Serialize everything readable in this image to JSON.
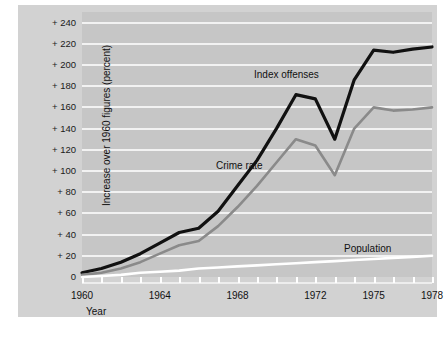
{
  "chart_data": {
    "type": "line",
    "title": "",
    "xlabel": "Year",
    "ylabel": "Increase over 1960 figures (percent)",
    "xlim": [
      1960,
      1978
    ],
    "ylim": [
      0,
      250
    ],
    "grid": true,
    "legend_position": "inline-annotations",
    "x": [
      1960,
      1961,
      1962,
      1963,
      1964,
      1965,
      1966,
      1967,
      1968,
      1969,
      1970,
      1971,
      1972,
      1973,
      1974,
      1975,
      1976,
      1977,
      1978
    ],
    "xtick_labels": [
      "1960",
      "1964",
      "1968",
      "1972",
      "1975",
      "1978"
    ],
    "xtick_values": [
      1960,
      1964,
      1968,
      1972,
      1975,
      1978
    ],
    "ytick_labels": [
      "0",
      "+ 20",
      "+ 40",
      "+ 60",
      "+ 80",
      "+ 100",
      "+ 120",
      "+ 140",
      "+ 160",
      "+ 180",
      "+ 200",
      "+ 220",
      "+ 240"
    ],
    "ytick_values": [
      0,
      20,
      40,
      60,
      80,
      100,
      120,
      140,
      160,
      180,
      200,
      220,
      240
    ],
    "series": [
      {
        "name": "Index offenses",
        "color": "#111111",
        "values": [
          4,
          8,
          14,
          22,
          32,
          42,
          46,
          62,
          86,
          110,
          140,
          172,
          168,
          130,
          186,
          214,
          212,
          215,
          217
        ]
      },
      {
        "name": "Crime rate",
        "color": "#8a8a8a",
        "values": [
          2,
          4,
          8,
          14,
          22,
          30,
          34,
          48,
          66,
          86,
          108,
          130,
          124,
          96,
          140,
          160,
          157,
          158,
          160
        ]
      },
      {
        "name": "Population",
        "color": "#ffffff",
        "values": [
          0,
          1,
          2,
          4,
          5,
          6,
          8,
          9,
          10,
          11,
          12,
          13,
          14,
          15,
          16,
          17,
          18,
          19,
          20
        ]
      }
    ],
    "annotations": [
      {
        "text": "Index offenses",
        "series": "Index offenses"
      },
      {
        "text": "Crime rate",
        "series": "Crime rate"
      },
      {
        "text": "Population",
        "series": "Population"
      }
    ]
  }
}
